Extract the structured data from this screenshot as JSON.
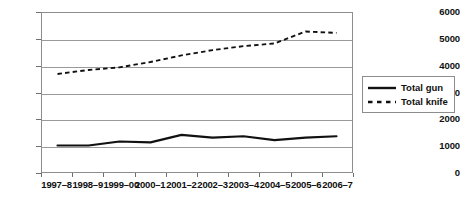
{
  "chart_data": {
    "type": "line",
    "title": "",
    "xlabel": "",
    "ylabel": "",
    "ylim": [
      0,
      6000
    ],
    "ytick_step": 1000,
    "yticks": [
      "6000",
      "5000",
      "4000",
      "3000",
      "2000",
      "1000",
      "0"
    ],
    "grid": true,
    "legend_position": "right",
    "categories": [
      "1997–8",
      "1998–9",
      "1999–00",
      "2000–1",
      "2001–2",
      "2002–3",
      "2003–4",
      "2004–5",
      "2005–6",
      "2006–7"
    ],
    "series": [
      {
        "name": "Total gun",
        "style": "solid",
        "color": "#111111",
        "values": [
          1000,
          1000,
          1150,
          1120,
          1400,
          1300,
          1350,
          1200,
          1300,
          1350
        ]
      },
      {
        "name": "Total knife",
        "style": "dashed",
        "color": "#111111",
        "values": [
          3700,
          3850,
          3950,
          4150,
          4400,
          4600,
          4750,
          4850,
          5300,
          5250
        ]
      }
    ]
  },
  "legend": {
    "items": [
      {
        "label": "Total gun",
        "style": "solid"
      },
      {
        "label": "Total knife",
        "style": "dashed"
      }
    ]
  }
}
